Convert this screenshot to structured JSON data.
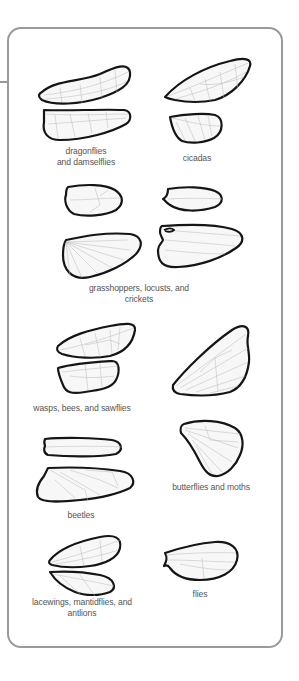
{
  "figure": {
    "type": "insect wing comparison diagram",
    "frame_color": "#9a9a9a",
    "outline_color": "#151515",
    "vein_color": "#b9b9b9",
    "label_color": "#555555"
  },
  "groups": [
    {
      "id": "dragonflies",
      "label_lines": [
        "dragonflies",
        "and damselflies"
      ]
    },
    {
      "id": "cicadas",
      "label_lines": [
        "cicadas"
      ]
    },
    {
      "id": "grasshoppers",
      "label_lines": [
        "grasshoppers, locusts, and",
        "crickets"
      ]
    },
    {
      "id": "wasps",
      "label_lines": [
        "wasps, bees, and sawflies"
      ]
    },
    {
      "id": "beetles",
      "label_lines": [
        "beetles"
      ]
    },
    {
      "id": "butterflies",
      "label_lines": [
        "butterflies and moths"
      ]
    },
    {
      "id": "lacewings",
      "label_lines": [
        "lacewings, mantidflies, and",
        "antlions"
      ]
    },
    {
      "id": "flies",
      "label_lines": [
        "flies"
      ]
    }
  ]
}
